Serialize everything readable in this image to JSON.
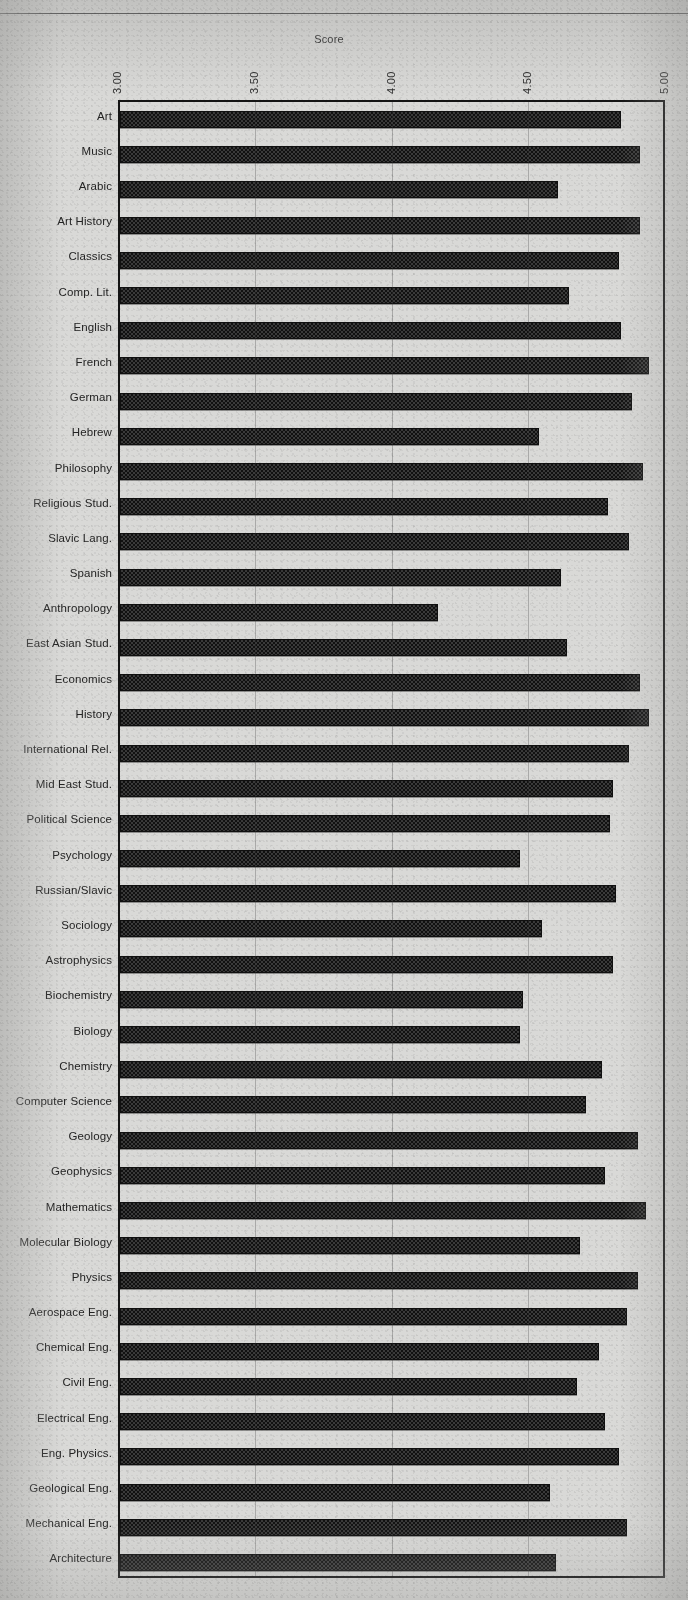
{
  "chart_data": {
    "type": "bar",
    "orientation": "horizontal",
    "title": "Score",
    "xlabel": "Score",
    "ylabel": "",
    "xlim": [
      3.0,
      5.0
    ],
    "xticks": [
      "3.00",
      "3.50",
      "4.00",
      "4.50",
      "5.00"
    ],
    "xtick_values": [
      3.0,
      3.5,
      4.0,
      4.5,
      5.0
    ],
    "grid": true,
    "grid_axis": "x",
    "legend": "none",
    "categories": [
      "Art",
      "Music",
      "Arabic",
      "Art History",
      "Classics",
      "Comp. Lit.",
      "English",
      "French",
      "German",
      "Hebrew",
      "Philosophy",
      "Religious Stud.",
      "Slavic Lang.",
      "Spanish",
      "Anthropology",
      "East Asian Stud.",
      "Economics",
      "History",
      "International Rel.",
      "Mid East Stud.",
      "Political  Science",
      "Psychology",
      "Russian/Slavic",
      "Sociology",
      "Astrophysics",
      "Biochemistry",
      "Biology",
      "Chemistry",
      "Computer Science",
      "Geology",
      "Geophysics",
      "Mathematics",
      "Molecular Biology",
      "Physics",
      "Aerospace Eng.",
      "Chemical Eng.",
      "Civil Eng.",
      "Electrical Eng.",
      "Eng. Physics.",
      "Geological Eng.",
      "Mechanical Eng.",
      "Architecture"
    ],
    "values": [
      4.84,
      4.91,
      4.61,
      4.91,
      4.83,
      4.65,
      4.84,
      4.94,
      4.88,
      4.54,
      4.92,
      4.79,
      4.87,
      4.62,
      4.17,
      4.64,
      4.91,
      4.94,
      4.87,
      4.81,
      4.8,
      4.47,
      4.82,
      4.55,
      4.81,
      4.48,
      4.47,
      4.77,
      4.71,
      4.9,
      4.78,
      4.93,
      4.69,
      4.9,
      4.86,
      4.76,
      4.68,
      4.78,
      4.83,
      4.58,
      4.86,
      4.6
    ]
  },
  "axis": {
    "title": "Score",
    "ticks": [
      {
        "label": "3.00",
        "value": 3.0
      },
      {
        "label": "3.50",
        "value": 3.5
      },
      {
        "label": "4.00",
        "value": 4.0
      },
      {
        "label": "4.50",
        "value": 4.5
      },
      {
        "label": "5.00",
        "value": 5.0
      }
    ]
  },
  "colors": {
    "page_background": "#d9d9d7",
    "bar_fill": "#3a3a3a",
    "bar_border": "#101010",
    "axis_line": "#141414",
    "grid_line": "#3c3c3c",
    "text": "#232323"
  }
}
